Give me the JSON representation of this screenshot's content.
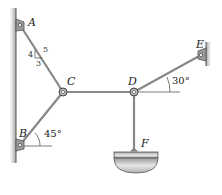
{
  "diagram": {
    "type": "truss-cable-system",
    "points": {
      "A": {
        "label": "A",
        "x": 20,
        "y": 25
      },
      "B": {
        "label": "B",
        "x": 20,
        "y": 145
      },
      "C": {
        "label": "C",
        "x": 63,
        "y": 92
      },
      "D": {
        "label": "D",
        "x": 134,
        "y": 92
      },
      "E": {
        "label": "E",
        "x": 201,
        "y": 55
      },
      "F": {
        "label": "F",
        "x": 134,
        "y": 150
      }
    },
    "slope_triangle": {
      "rise": "4",
      "run": "3",
      "hyp": "5"
    },
    "angles": {
      "B": "45°",
      "D": "30°"
    },
    "colors": {
      "member": "#8a8a8a",
      "wall": "#b5b5b5",
      "bowl": "#c8c8c8",
      "text": "#222222"
    }
  }
}
